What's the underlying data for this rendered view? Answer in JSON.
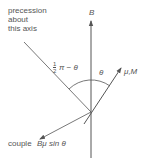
{
  "labels": {
    "precession_line1": "precession",
    "precession_line2": "about",
    "precession_line3": "this axis",
    "field_axis": "B",
    "complement_angle_half": "1",
    "complement_angle_half_den": "2",
    "complement_angle_rest": "π − θ",
    "theta": "θ",
    "moment_vector": "μ,M",
    "couple_prefix": "couple",
    "couple_formula": "Bμ sin θ"
  },
  "colors": {
    "line": "#555555",
    "text": "#555555",
    "background": "#ffffff"
  }
}
